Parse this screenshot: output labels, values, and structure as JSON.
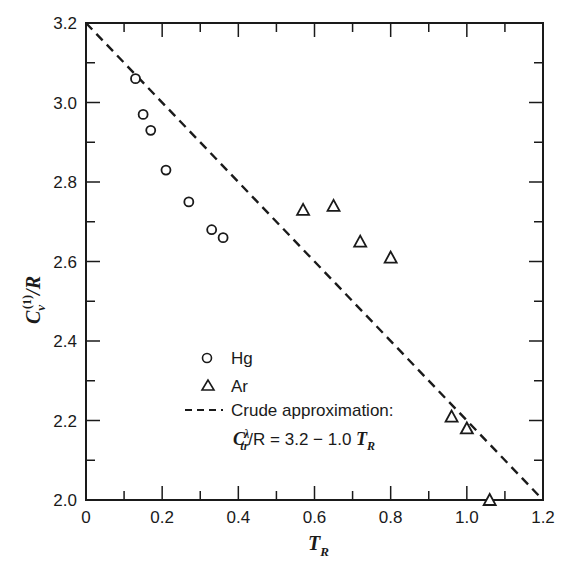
{
  "chart_data": {
    "type": "scatter",
    "title": "",
    "xlabel": "T_R",
    "ylabel": "C_v^(1)/R",
    "xlim": [
      0,
      1.2
    ],
    "ylim": [
      2.0,
      3.2
    ],
    "x_ticks": [
      "0",
      "0.2",
      "0.4",
      "0.6",
      "0.8",
      "1.0",
      "1.2"
    ],
    "y_ticks": [
      "2.0",
      "2.2",
      "2.4",
      "2.6",
      "2.8",
      "3.0",
      "3.2"
    ],
    "grid": false,
    "legend_position": "lower center-left, inside",
    "series": [
      {
        "name": "Hg",
        "marker": "circle",
        "x": [
          0.13,
          0.15,
          0.17,
          0.21,
          0.27,
          0.33,
          0.36
        ],
        "y": [
          3.06,
          2.97,
          2.93,
          2.83,
          2.75,
          2.68,
          2.66
        ]
      },
      {
        "name": "Ar",
        "marker": "triangle",
        "x": [
          0.57,
          0.65,
          0.72,
          0.8,
          0.96,
          1.0,
          1.06
        ],
        "y": [
          2.73,
          2.74,
          2.65,
          2.61,
          2.21,
          2.18,
          2.0
        ]
      },
      {
        "name": "Crude approximation: C_tr^λ/R = 3.2 − 1.0 T_R",
        "type": "line",
        "style": "dashed",
        "x": [
          0,
          1.2
        ],
        "y": [
          3.2,
          2.0
        ]
      }
    ]
  },
  "legend": {
    "hg": "Hg",
    "ar": "Ar",
    "approx_line1": "Crude approximation:",
    "approx_eq_lhs": "C",
    "approx_eq_sup": "λ",
    "approx_eq_sub": "tr",
    "approx_eq_rest": "/R = 3.2 − 1.0 ",
    "approx_eq_T": "T",
    "approx_eq_Tsub": "R"
  },
  "axes": {
    "x_label_main": "T",
    "x_label_sub": "R",
    "y_label_main": "C",
    "y_label_sub": "v",
    "y_label_sup": "(1)",
    "y_label_tail": "/R"
  }
}
